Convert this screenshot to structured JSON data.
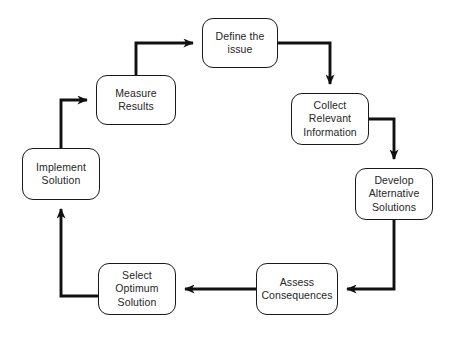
{
  "diagram": {
    "type": "cyclic-flowchart",
    "direction": "clockwise",
    "style": {
      "box_fill": "#ffffff",
      "box_stroke": "#1a1a1a",
      "text_color": "#262626",
      "arrow_color": "#111111",
      "background": "#ffffff"
    },
    "nodes": [
      {
        "id": "define-the-issue",
        "label": "Define the\nissue",
        "x": 202,
        "y": 18,
        "w": 76,
        "h": 50
      },
      {
        "id": "collect-relevant-information",
        "label": "Collect\nRelevant\nInformation",
        "x": 291,
        "y": 93,
        "w": 78,
        "h": 52
      },
      {
        "id": "develop-alternative-solutions",
        "label": "Develop\nAlternative\nSolutions",
        "x": 355,
        "y": 168,
        "w": 78,
        "h": 52
      },
      {
        "id": "assess-consequences",
        "label": "Assess\nConsequences",
        "x": 256,
        "y": 263,
        "w": 82,
        "h": 52
      },
      {
        "id": "select-optimum-solution",
        "label": "Select\nOptimum\nSolution",
        "x": 98,
        "y": 263,
        "w": 78,
        "h": 52
      },
      {
        "id": "implement-solution",
        "label": "Implement\nSolution",
        "x": 22,
        "y": 148,
        "w": 78,
        "h": 52
      },
      {
        "id": "measure-results",
        "label": "Measure\nResults",
        "x": 96,
        "y": 75,
        "w": 80,
        "h": 50
      }
    ],
    "edges": [
      {
        "id": "edge-define-to-collect",
        "from": "define-the-issue",
        "to": "collect-relevant-information"
      },
      {
        "id": "edge-collect-to-develop",
        "from": "collect-relevant-information",
        "to": "develop-alternative-solutions"
      },
      {
        "id": "edge-develop-to-assess",
        "from": "develop-alternative-solutions",
        "to": "assess-consequences"
      },
      {
        "id": "edge-assess-to-select",
        "from": "assess-consequences",
        "to": "select-optimum-solution"
      },
      {
        "id": "edge-select-to-implement",
        "from": "select-optimum-solution",
        "to": "implement-solution"
      },
      {
        "id": "edge-implement-to-measure",
        "from": "implement-solution",
        "to": "measure-results"
      },
      {
        "id": "edge-measure-to-define",
        "from": "measure-results",
        "to": "define-the-issue"
      }
    ]
  }
}
